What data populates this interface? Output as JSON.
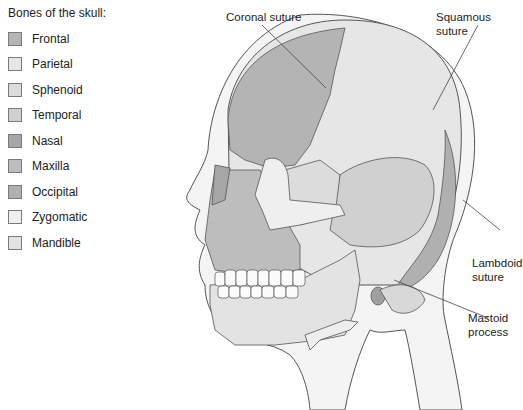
{
  "legend": {
    "title": "Bones of the skull:",
    "items": [
      {
        "label": "Frontal",
        "color": "#b4b4b4"
      },
      {
        "label": "Parietal",
        "color": "#e6e6e6"
      },
      {
        "label": "Sphenoid",
        "color": "#dcdcdc"
      },
      {
        "label": "Temporal",
        "color": "#d0d0d0"
      },
      {
        "label": "Nasal",
        "color": "#a6a6a6"
      },
      {
        "label": "Maxilla",
        "color": "#bdbdbd"
      },
      {
        "label": "Occipital",
        "color": "#b0b0b0"
      },
      {
        "label": "Zygomatic",
        "color": "#efefef"
      },
      {
        "label": "Mandible",
        "color": "#e3e3e3"
      }
    ]
  },
  "callouts": {
    "coronal": "Coronal suture",
    "squamous": "Squamous suture",
    "lambdoid_1": "Lambdoid",
    "lambdoid_2": "suture",
    "mastoid_1": "Mastoid",
    "mastoid_2": "process"
  }
}
